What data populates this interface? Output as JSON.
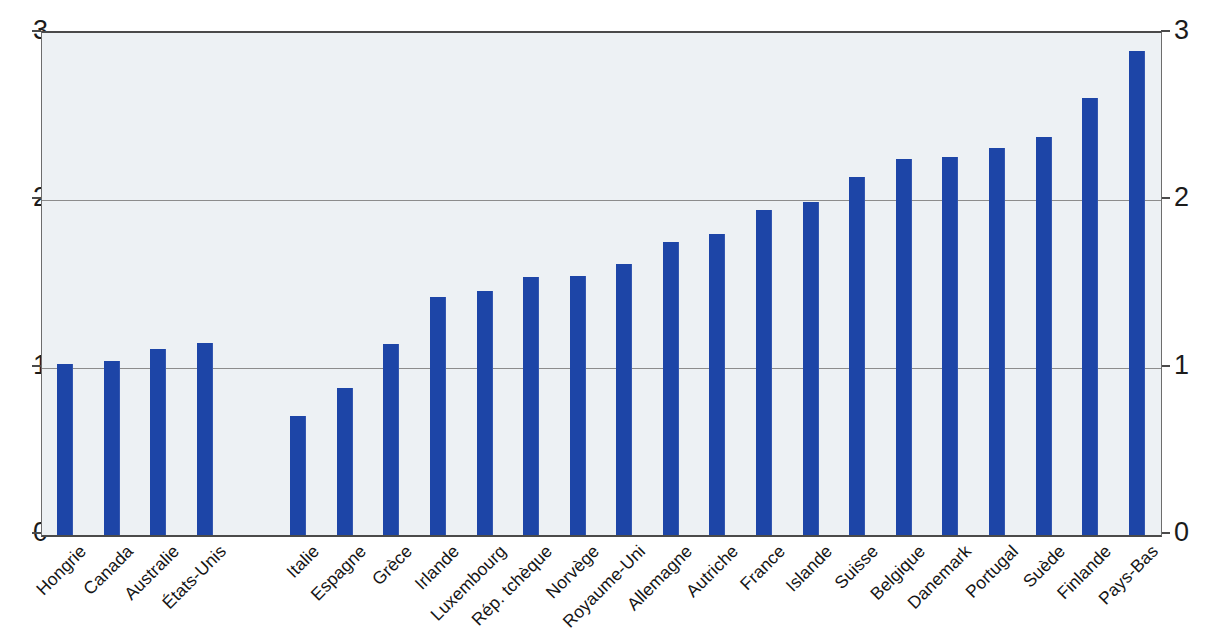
{
  "chart_data": {
    "type": "bar",
    "title": "",
    "subtitle": "",
    "xlabel": "",
    "ylabel": "",
    "ylim": [
      0,
      3
    ],
    "yticks": [
      0,
      1,
      2,
      3
    ],
    "ytick_labels": [
      "0",
      "1",
      "2",
      "3"
    ],
    "grid": "horizontal",
    "legend": "none",
    "dual_y_axis": true,
    "bar_color": "#1d45a7",
    "plot_background": "#edf1f4",
    "gridline_color": "#8c8c8c",
    "axis_color": "#4a4a4a",
    "categories": [
      "Hongrie",
      "Canada",
      "Australie",
      "États-Unis",
      "Italie",
      "Espagne",
      "Grèce",
      "Irlande",
      "Luxembourg",
      "Rép. tchèque",
      "Norvège",
      "Royaume-Uni",
      "Allemagne",
      "Autriche",
      "France",
      "Islande",
      "Suisse",
      "Belgique",
      "Danemark",
      "Portugal",
      "Suède",
      "Finlande",
      "Pays-Bas"
    ],
    "values": [
      1.02,
      1.04,
      1.11,
      1.15,
      0.71,
      0.88,
      1.14,
      1.42,
      1.46,
      1.54,
      1.55,
      1.62,
      1.75,
      1.8,
      1.94,
      1.99,
      2.14,
      2.25,
      2.26,
      2.31,
      2.38,
      2.61,
      2.89
    ],
    "slot_indices": [
      0,
      1,
      2,
      3,
      5,
      6,
      7,
      8,
      9,
      10,
      11,
      12,
      13,
      14,
      15,
      16,
      17,
      18,
      19,
      20,
      21,
      22,
      23
    ],
    "slot_count": 24,
    "gap_after_category": "États-Unis",
    "annotations": []
  }
}
